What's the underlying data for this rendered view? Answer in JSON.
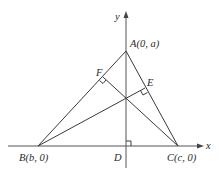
{
  "diagram": {
    "title": "",
    "axes": {
      "x_label": "x",
      "y_label": "y"
    },
    "points": {
      "A": {
        "label": "A(0, a)",
        "px": [
          126,
          51
        ]
      },
      "B": {
        "label": "B(b, 0)",
        "px": [
          38,
          146
        ]
      },
      "C": {
        "label": "C(c, 0)",
        "px": [
          178,
          146
        ]
      },
      "D": {
        "label": "D",
        "px": [
          126,
          146
        ]
      },
      "E": {
        "label": "E",
        "px": [
          145,
          88
        ]
      },
      "F": {
        "label": "F",
        "px": [
          103,
          77
        ]
      }
    },
    "segments": [
      "AB",
      "AC",
      "BC",
      "AD",
      "BE",
      "CF"
    ],
    "right_angles": [
      "D",
      "E",
      "F"
    ],
    "colors": {
      "stroke": "#3a3a3a",
      "text": "#2a2a2a",
      "background": "#ffffff"
    }
  }
}
